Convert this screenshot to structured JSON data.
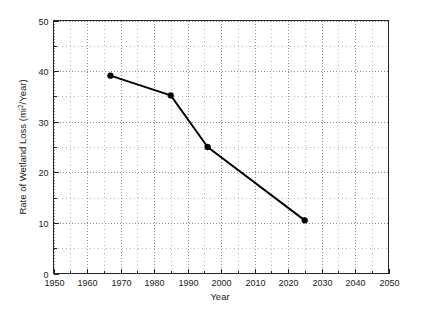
{
  "chart_data": {
    "type": "line",
    "title": "",
    "xlabel": "Year",
    "ylabel": "Rate of Wetland Loss (mi2/Year)",
    "ylabel_prefix": "Rate of Wetland Loss (mi",
    "ylabel_superscript": "2",
    "ylabel_suffix": "/Year)",
    "xlim": [
      1950,
      2050
    ],
    "ylim": [
      0,
      50
    ],
    "xticks": [
      1950,
      1960,
      1970,
      1980,
      1990,
      2000,
      2010,
      2020,
      2030,
      2040,
      2050
    ],
    "yticks": [
      0,
      10,
      20,
      30,
      40,
      50
    ],
    "xtick_labels": [
      "1950",
      "1960",
      "1970",
      "1980",
      "1990",
      "2000",
      "2010",
      "2020",
      "2030",
      "2040",
      "2050"
    ],
    "ytick_labels": [
      "0",
      "10",
      "20",
      "30",
      "40",
      "50"
    ],
    "x_minor_step": 5,
    "y_minor_step": 5,
    "grid": true,
    "grid_style": "dotted",
    "grid_color": "#808080",
    "legend": "none",
    "series": [
      {
        "name": "Rate of Wetland Loss",
        "marker": "filled-circle",
        "color": "#000000",
        "x": [
          1967,
          1985,
          1996,
          2025
        ],
        "values": [
          39.1,
          35.2,
          25.0,
          10.5
        ],
        "points": [
          {
            "x": 1967,
            "y": 39.1
          },
          {
            "x": 1985,
            "y": 35.2
          },
          {
            "x": 1996,
            "y": 25.0
          },
          {
            "x": 2025,
            "y": 10.5
          }
        ]
      }
    ]
  },
  "style": {
    "background": "#ffffff",
    "frame_color": "#262626",
    "line_color": "#000000",
    "marker_color": "#000000",
    "text_color": "#1a1a1a"
  }
}
